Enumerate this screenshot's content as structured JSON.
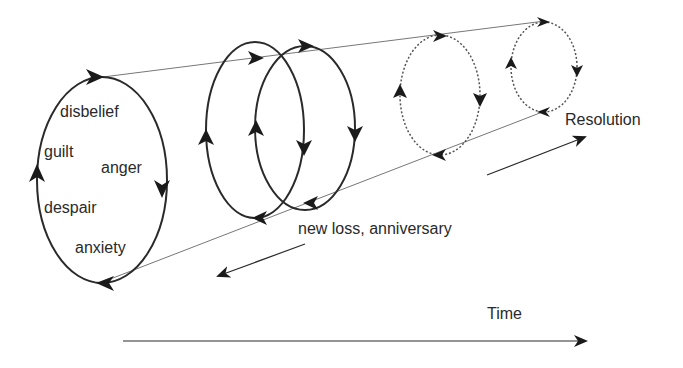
{
  "diagram": {
    "type": "spiral-cone process diagram",
    "emotions": {
      "disbelief": "disbelief",
      "guilt": "guilt",
      "anger": "anger",
      "despair": "despair",
      "anxiety": "anxiety"
    },
    "labels": {
      "new_loss": "new loss, anniversary",
      "resolution": "Resolution",
      "time": "Time"
    },
    "colors": {
      "stroke": "#2a2a2a",
      "thin_line": "#777777",
      "text": "#2a2a2a"
    },
    "cycles": [
      {
        "id": "cycle-1",
        "style": "solid",
        "cx": 102,
        "cy": 180,
        "rx": 65,
        "ry": 103
      },
      {
        "id": "cycle-2",
        "style": "solid",
        "cx": 255,
        "cy": 130,
        "rx": 49,
        "ry": 88
      },
      {
        "id": "cycle-3",
        "style": "solid",
        "cx": 305,
        "cy": 128,
        "rx": 50,
        "ry": 82
      },
      {
        "id": "cycle-4",
        "style": "dotted",
        "cx": 440,
        "cy": 95,
        "rx": 40,
        "ry": 60
      },
      {
        "id": "cycle-5",
        "style": "dotted",
        "cx": 544,
        "cy": 67,
        "rx": 33,
        "ry": 45
      }
    ]
  }
}
